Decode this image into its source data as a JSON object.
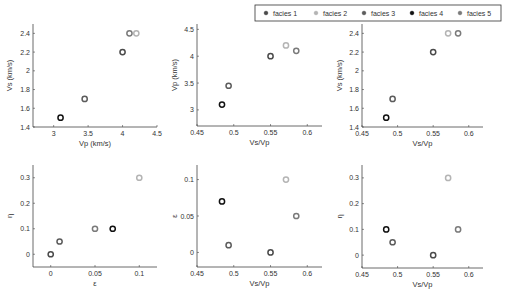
{
  "legend": {
    "entries": [
      {
        "label": "facies 1",
        "color": "#4a4a4a"
      },
      {
        "label": "facies 2",
        "color": "#b4b4b4"
      },
      {
        "label": "facies 3",
        "color": "#5c5c5c"
      },
      {
        "label": "facies 4",
        "color": "#111111"
      },
      {
        "label": "facies 5",
        "color": "#7a7a7a"
      }
    ]
  },
  "chart_data": [
    {
      "type": "scatter",
      "title": "",
      "xlabel": "Vp (km/s)",
      "ylabel": "Vs (km/s)",
      "xlim": [
        2.7,
        4.5
      ],
      "ylim": [
        1.4,
        2.5
      ],
      "xticks": [
        "3",
        "3.5",
        "4",
        "4.5"
      ],
      "yticks": [
        "1.4",
        "1.6",
        "1.8",
        "2",
        "2.2",
        "2.4"
      ],
      "series": [
        {
          "name": "facies 1",
          "x": [
            4.0
          ],
          "y": [
            2.2
          ]
        },
        {
          "name": "facies 2",
          "x": [
            4.2
          ],
          "y": [
            2.4
          ]
        },
        {
          "name": "facies 3",
          "x": [
            3.45
          ],
          "y": [
            1.7
          ]
        },
        {
          "name": "facies 4",
          "x": [
            3.1
          ],
          "y": [
            1.5
          ]
        },
        {
          "name": "facies 5",
          "x": [
            4.1
          ],
          "y": [
            2.4
          ]
        }
      ]
    },
    {
      "type": "scatter",
      "title": "",
      "xlabel": "Vs/Vp",
      "ylabel": "Vp (km/s)",
      "xlim": [
        0.45,
        0.62
      ],
      "ylim": [
        2.7,
        4.6
      ],
      "xticks": [
        "0.45",
        "0.5",
        "0.55",
        "0.6"
      ],
      "yticks": [
        "3",
        "3.5",
        "4",
        "4.5"
      ],
      "series": [
        {
          "name": "facies 1",
          "x": [
            0.55
          ],
          "y": [
            4.0
          ]
        },
        {
          "name": "facies 2",
          "x": [
            0.571
          ],
          "y": [
            4.2
          ]
        },
        {
          "name": "facies 3",
          "x": [
            0.493
          ],
          "y": [
            3.45
          ]
        },
        {
          "name": "facies 4",
          "x": [
            0.484
          ],
          "y": [
            3.1
          ]
        },
        {
          "name": "facies 5",
          "x": [
            0.585
          ],
          "y": [
            4.1
          ]
        }
      ]
    },
    {
      "type": "scatter",
      "title": "",
      "xlabel": "Vs/Vp",
      "ylabel": "Vs (km/s)",
      "xlim": [
        0.45,
        0.62
      ],
      "ylim": [
        1.4,
        2.5
      ],
      "xticks": [
        "0.45",
        "0.5",
        "0.55",
        "0.6"
      ],
      "yticks": [
        "1.4",
        "1.6",
        "1.8",
        "2",
        "2.2",
        "2.4"
      ],
      "series": [
        {
          "name": "facies 1",
          "x": [
            0.55
          ],
          "y": [
            2.2
          ]
        },
        {
          "name": "facies 2",
          "x": [
            0.571
          ],
          "y": [
            2.4
          ]
        },
        {
          "name": "facies 3",
          "x": [
            0.493
          ],
          "y": [
            1.7
          ]
        },
        {
          "name": "facies 4",
          "x": [
            0.484
          ],
          "y": [
            1.5
          ]
        },
        {
          "name": "facies 5",
          "x": [
            0.585
          ],
          "y": [
            2.4
          ]
        }
      ]
    },
    {
      "type": "scatter",
      "title": "",
      "xlabel": "ε",
      "ylabel": "η",
      "xlim": [
        -0.02,
        0.12
      ],
      "ylim": [
        -0.05,
        0.35
      ],
      "xticks": [
        "0",
        "0.05",
        "0.1"
      ],
      "yticks": [
        "0",
        "0.1",
        "0.2",
        "0.3"
      ],
      "series": [
        {
          "name": "facies 1",
          "x": [
            0.0
          ],
          "y": [
            0.0
          ]
        },
        {
          "name": "facies 2",
          "x": [
            0.1
          ],
          "y": [
            0.3
          ]
        },
        {
          "name": "facies 3",
          "x": [
            0.01
          ],
          "y": [
            0.05
          ]
        },
        {
          "name": "facies 4",
          "x": [
            0.07
          ],
          "y": [
            0.1
          ]
        },
        {
          "name": "facies 5",
          "x": [
            0.05
          ],
          "y": [
            0.1
          ]
        }
      ]
    },
    {
      "type": "scatter",
      "title": "",
      "xlabel": "Vs/Vp",
      "ylabel": "ε",
      "xlim": [
        0.45,
        0.62
      ],
      "ylim": [
        -0.02,
        0.12
      ],
      "xticks": [
        "0.45",
        "0.5",
        "0.55",
        "0.6"
      ],
      "yticks": [
        "0",
        "0.05",
        "0.1"
      ],
      "series": [
        {
          "name": "facies 1",
          "x": [
            0.55
          ],
          "y": [
            0.0
          ]
        },
        {
          "name": "facies 2",
          "x": [
            0.571
          ],
          "y": [
            0.1
          ]
        },
        {
          "name": "facies 3",
          "x": [
            0.493
          ],
          "y": [
            0.01
          ]
        },
        {
          "name": "facies 4",
          "x": [
            0.484
          ],
          "y": [
            0.07
          ]
        },
        {
          "name": "facies 5",
          "x": [
            0.585
          ],
          "y": [
            0.05
          ]
        }
      ]
    },
    {
      "type": "scatter",
      "title": "",
      "xlabel": "Vs/Vp",
      "ylabel": "η",
      "xlim": [
        0.45,
        0.62
      ],
      "ylim": [
        -0.05,
        0.35
      ],
      "xticks": [
        "0.45",
        "0.5",
        "0.55",
        "0.6"
      ],
      "yticks": [
        "0",
        "0.1",
        "0.2",
        "0.3"
      ],
      "series": [
        {
          "name": "facies 1",
          "x": [
            0.55
          ],
          "y": [
            0.0
          ]
        },
        {
          "name": "facies 2",
          "x": [
            0.571
          ],
          "y": [
            0.3
          ]
        },
        {
          "name": "facies 3",
          "x": [
            0.493
          ],
          "y": [
            0.05
          ]
        },
        {
          "name": "facies 4",
          "x": [
            0.484
          ],
          "y": [
            0.1
          ]
        },
        {
          "name": "facies 5",
          "x": [
            0.585
          ],
          "y": [
            0.1
          ]
        }
      ]
    }
  ]
}
